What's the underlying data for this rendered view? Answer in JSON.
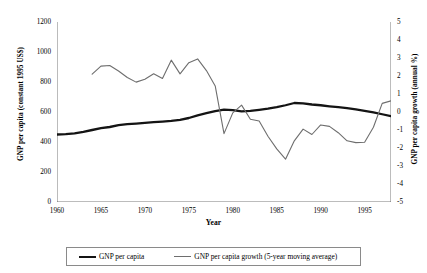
{
  "chart_data": {
    "type": "line",
    "title": "",
    "xlabel": "Year",
    "ylabel": "GNP per capita (constant 1995 US$)",
    "y2label": "GNP per capita growth (annual %)",
    "xlim": [
      1960,
      1998
    ],
    "ylim": [
      0,
      1200
    ],
    "y2lim": [
      -5,
      5
    ],
    "xticks": [
      1960,
      1965,
      1970,
      1975,
      1980,
      1985,
      1990,
      1995
    ],
    "xtick_labels": [
      "1960",
      "1965",
      "1970",
      "1975",
      "1980",
      "1985",
      "1990",
      "1995"
    ],
    "yticks": [
      0,
      200,
      400,
      600,
      800,
      1000,
      1200
    ],
    "ytick_labels": [
      "0",
      "200",
      "400",
      "600",
      "800",
      "1000",
      "1200"
    ],
    "y2ticks": [
      -5,
      -4,
      -3,
      -2,
      -1,
      0,
      1,
      2,
      3,
      4,
      5
    ],
    "y2tick_labels": [
      "-5",
      "-4",
      "-3",
      "-2",
      "-1",
      "0",
      "1",
      "2",
      "3",
      "4",
      "5"
    ],
    "grid": false,
    "legend_position": "bottom",
    "series": [
      {
        "name": "GNP per capita",
        "axis": "left",
        "color": "#141414",
        "width": 2.3,
        "x": [
          1960,
          1961,
          1962,
          1963,
          1964,
          1965,
          1966,
          1967,
          1968,
          1969,
          1970,
          1971,
          1972,
          1973,
          1974,
          1975,
          1976,
          1977,
          1978,
          1979,
          1980,
          1981,
          1982,
          1983,
          1984,
          1985,
          1986,
          1987,
          1988,
          1989,
          1990,
          1991,
          1992,
          1993,
          1994,
          1995,
          1996,
          1997,
          1998
        ],
        "values": [
          450,
          452,
          458,
          468,
          480,
          492,
          500,
          512,
          519,
          523,
          528,
          532,
          536,
          541,
          548,
          560,
          578,
          592,
          606,
          616,
          612,
          604,
          607,
          614,
          622,
          632,
          645,
          660,
          658,
          650,
          645,
          638,
          632,
          626,
          617,
          608,
          598,
          585,
          572
        ]
      },
      {
        "name": "GNP per capita growth (5-year moving average)",
        "axis": "right",
        "color": "#6e6e6e",
        "width": 1.1,
        "x": [
          1964,
          1965,
          1966,
          1967,
          1968,
          1969,
          1970,
          1971,
          1972,
          1973,
          1974,
          1975,
          1976,
          1977,
          1978,
          1979,
          1980,
          1981,
          1982,
          1983,
          1984,
          1985,
          1986,
          1987,
          1988,
          1989,
          1990,
          1991,
          1992,
          1993,
          1994,
          1995,
          1996,
          1997,
          1998
        ],
        "values": [
          2.1,
          2.55,
          2.58,
          2.28,
          1.92,
          1.66,
          1.82,
          2.12,
          1.86,
          2.88,
          2.12,
          2.74,
          2.95,
          2.3,
          1.45,
          -1.2,
          -0.05,
          0.38,
          -0.4,
          -0.5,
          -1.35,
          -2.05,
          -2.62,
          -1.6,
          -0.95,
          -1.25,
          -0.72,
          -0.8,
          -1.15,
          -1.6,
          -1.7,
          -1.68,
          -0.85,
          0.48,
          0.62
        ]
      }
    ]
  },
  "legend": {
    "items": [
      {
        "label": "GNP per capita"
      },
      {
        "label": "GNP per capita growth (5-year moving average)"
      }
    ]
  }
}
